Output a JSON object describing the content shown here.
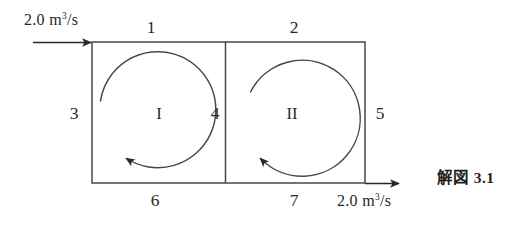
{
  "figure": {
    "caption_label": "解図",
    "caption_number": "3.1",
    "caption_full": "解図 3.1"
  },
  "flows": {
    "inlet": {
      "value": "2.0",
      "unit_prefix": "m",
      "unit_exponent": "3",
      "unit_suffix": "/s",
      "text": "2.0 m3/s",
      "direction": "right",
      "position": "top-left"
    },
    "outlet": {
      "value": "2.0",
      "unit_prefix": "m",
      "unit_exponent": "3",
      "unit_suffix": "/s",
      "text": "2.0 m3/s",
      "direction": "right",
      "position": "bottom-right"
    }
  },
  "loops": [
    {
      "name": "I",
      "rotation": "counterclockwise"
    },
    {
      "name": "II",
      "rotation": "counterclockwise"
    }
  ],
  "pipe_labels": [
    {
      "id": "1",
      "position": "top-left"
    },
    {
      "id": "2",
      "position": "top-right"
    },
    {
      "id": "3",
      "position": "left-outer"
    },
    {
      "id": "4",
      "position": "middle-divider"
    },
    {
      "id": "5",
      "position": "right-outer"
    },
    {
      "id": "6",
      "position": "bottom-left"
    },
    {
      "id": "7",
      "position": "bottom-right"
    }
  ],
  "colors": {
    "line": "#4a4745",
    "text": "#2b2724",
    "background": "#ffffff"
  }
}
